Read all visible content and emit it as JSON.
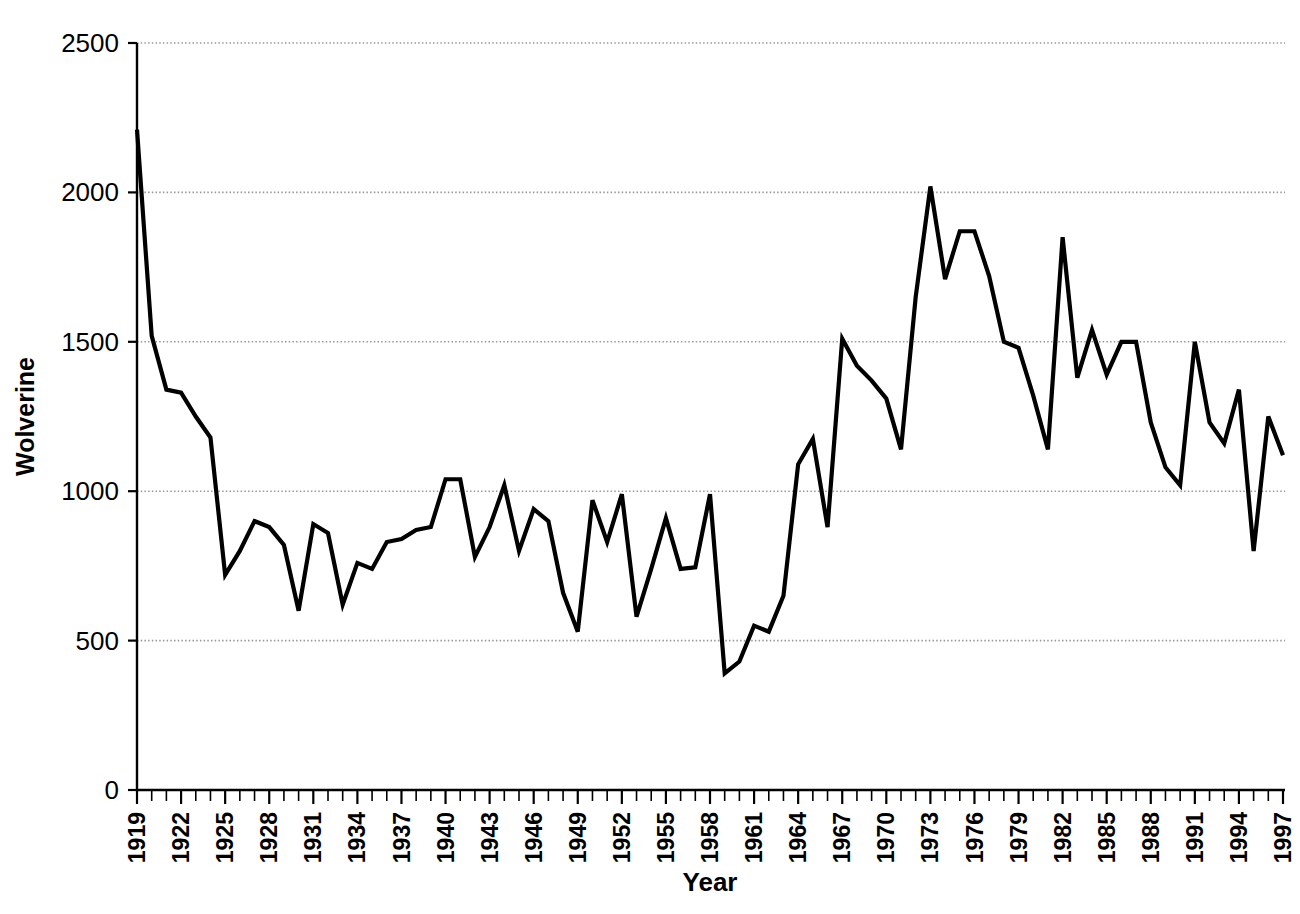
{
  "chart_data": {
    "type": "line",
    "title": "",
    "xlabel": "Year",
    "ylabel": "Wolverine",
    "xlim": [
      1919,
      1997
    ],
    "ylim": [
      0,
      2500
    ],
    "grid": true,
    "gridlines_y": [
      500,
      1000,
      1500,
      2000,
      2500
    ],
    "legend": "none",
    "line_color": "#000000",
    "axis_color": "#000000",
    "grid_color": "#999999",
    "background": "#ffffff",
    "ytick_labels": [
      "0",
      "500",
      "1000",
      "1500",
      "2000",
      "2500"
    ],
    "ytick_values": [
      0,
      500,
      1000,
      1500,
      2000,
      2500
    ],
    "xtick_labels": [
      "1919",
      "1922",
      "1925",
      "1928",
      "1931",
      "1934",
      "1937",
      "1940",
      "1943",
      "1946",
      "1949",
      "1952",
      "1955",
      "1958",
      "1961",
      "1964",
      "1967",
      "1970",
      "1973",
      "1976",
      "1979",
      "1982",
      "1985",
      "1988",
      "1991",
      "1994",
      "1997"
    ],
    "xtick_values": [
      1919,
      1922,
      1925,
      1928,
      1931,
      1934,
      1937,
      1940,
      1943,
      1946,
      1949,
      1952,
      1955,
      1958,
      1961,
      1964,
      1967,
      1970,
      1973,
      1976,
      1979,
      1982,
      1985,
      1988,
      1991,
      1994,
      1997
    ],
    "xtick_step": 3,
    "minor_tick_step": 1,
    "x": [
      1919,
      1920,
      1921,
      1922,
      1923,
      1924,
      1925,
      1926,
      1927,
      1928,
      1929,
      1930,
      1931,
      1932,
      1933,
      1934,
      1935,
      1936,
      1937,
      1938,
      1939,
      1940,
      1941,
      1942,
      1943,
      1944,
      1945,
      1946,
      1947,
      1948,
      1949,
      1950,
      1951,
      1952,
      1953,
      1954,
      1955,
      1956,
      1957,
      1958,
      1959,
      1960,
      1961,
      1962,
      1963,
      1964,
      1965,
      1966,
      1967,
      1968,
      1969,
      1970,
      1971,
      1972,
      1973,
      1974,
      1975,
      1976,
      1977,
      1978,
      1979,
      1980,
      1981,
      1982,
      1983,
      1984,
      1985,
      1986,
      1987,
      1988,
      1989,
      1990,
      1991,
      1992,
      1993,
      1994,
      1995,
      1996,
      1997
    ],
    "values": [
      2210,
      1520,
      1340,
      1330,
      1250,
      1180,
      720,
      800,
      900,
      880,
      820,
      600,
      890,
      860,
      620,
      760,
      740,
      830,
      840,
      870,
      880,
      1040,
      1040,
      780,
      880,
      1020,
      800,
      940,
      900,
      660,
      530,
      970,
      830,
      990,
      580,
      740,
      910,
      740,
      745,
      990,
      390,
      430,
      550,
      530,
      650,
      1090,
      1175,
      880,
      1510,
      1420,
      1370,
      1310,
      1140,
      1650,
      2020,
      1710,
      1870,
      1870,
      1720,
      1500,
      1480,
      1320,
      1140,
      1850,
      1380,
      1540,
      1390,
      1500,
      1500,
      1230,
      1080,
      1020,
      1500,
      1230,
      1160,
      1340,
      800,
      1250,
      1120
    ],
    "series": [
      {
        "name": "Wolverine",
        "values": [
          2210,
          1520,
          1340,
          1330,
          1250,
          1180,
          720,
          800,
          900,
          880,
          820,
          600,
          890,
          860,
          620,
          760,
          740,
          830,
          840,
          870,
          880,
          1040,
          1040,
          780,
          880,
          1020,
          800,
          940,
          900,
          660,
          530,
          970,
          830,
          990,
          580,
          740,
          910,
          740,
          745,
          990,
          390,
          430,
          550,
          530,
          650,
          1090,
          1175,
          880,
          1510,
          1420,
          1370,
          1310,
          1140,
          1650,
          2020,
          1710,
          1870,
          1870,
          1720,
          1500,
          1480,
          1320,
          1140,
          1850,
          1380,
          1540,
          1390,
          1500,
          1500,
          1230,
          1080,
          1020,
          1500,
          1230,
          1160,
          1340,
          800,
          1250,
          1120
        ]
      }
    ],
    "annotations": {
      "max_value": 2210,
      "max_year": 1919,
      "min_value": 390,
      "min_year": 1959
    }
  }
}
